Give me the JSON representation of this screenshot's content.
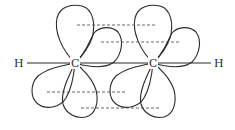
{
  "diagram": {
    "type": "molecular-orbital",
    "atoms": [
      {
        "id": "H1",
        "label": "H",
        "x": 18,
        "y": 63
      },
      {
        "id": "C1",
        "label": "C",
        "x": 75,
        "y": 63
      },
      {
        "id": "C2",
        "label": "C",
        "x": 153,
        "y": 63
      },
      {
        "id": "H2",
        "label": "H",
        "x": 218,
        "y": 63
      }
    ],
    "bonds": [
      {
        "from": "H1",
        "to": "C1"
      },
      {
        "from": "C1",
        "to": "C2"
      },
      {
        "from": "C2",
        "to": "H2"
      }
    ],
    "pi_overlap_lines": [
      {
        "x1": 77,
        "x2": 155,
        "y": 25
      },
      {
        "x1": 101,
        "x2": 180,
        "y": 42
      },
      {
        "x1": 47,
        "x2": 125,
        "y": 92
      },
      {
        "x1": 81,
        "x2": 160,
        "y": 108
      }
    ],
    "colors": {
      "stroke": "#2a2a2a",
      "dash": "#555555",
      "background": "#ffffff"
    }
  }
}
